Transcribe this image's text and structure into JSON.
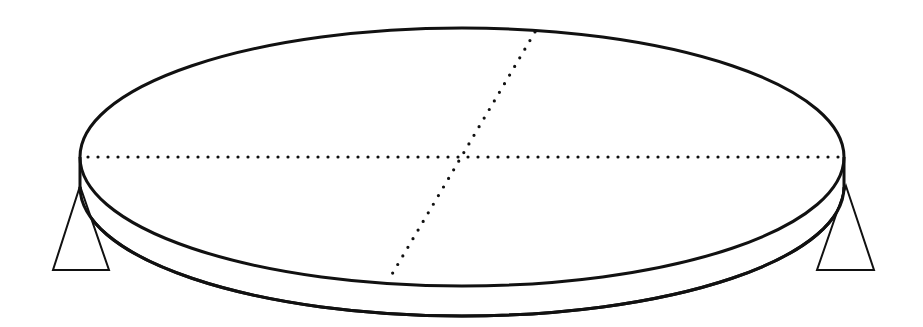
{
  "diagram": {
    "plate": {
      "cx": 462,
      "cy": 157,
      "rx": 382,
      "ry": 129,
      "thickness": 30
    },
    "diameters": [
      {
        "name": "horizontal",
        "x1": 84,
        "y1": 157,
        "x2": 842,
        "y2": 157
      },
      {
        "name": "oblique",
        "x1": 535,
        "y1": 32,
        "x2": 388,
        "y2": 281
      }
    ],
    "supports": [
      {
        "name": "left",
        "apex": [
          80,
          186
        ],
        "base_left": [
          53,
          270
        ],
        "base_right": [
          109,
          270
        ]
      },
      {
        "name": "right",
        "apex": [
          846,
          186
        ],
        "base_left": [
          817,
          270
        ],
        "base_right": [
          874,
          270
        ]
      }
    ],
    "colors": {
      "line": "#111111",
      "background": "#ffffff"
    }
  }
}
